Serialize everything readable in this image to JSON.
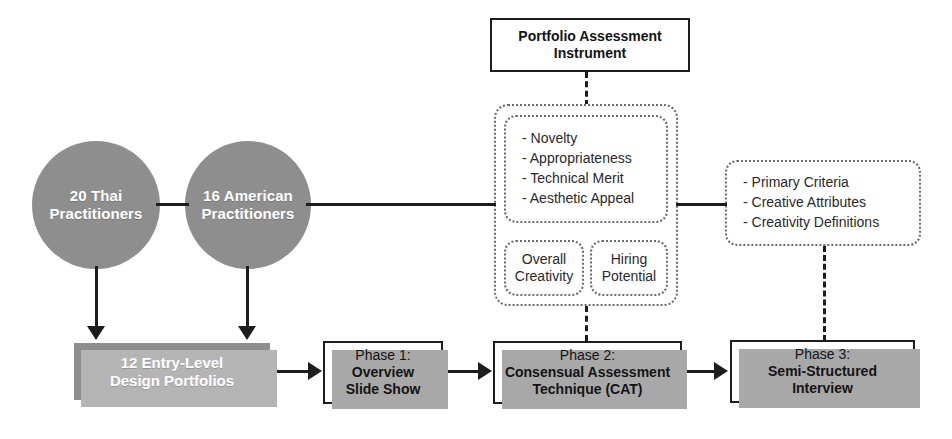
{
  "diagram": {
    "title": "Portfolio Assessment Instrument",
    "colors": {
      "fill_gray": "#8e8e8e",
      "shadow_gray": "#b4b4b4",
      "stroke_black": "#1d1d1d",
      "dashed_gray": "#6b6b6b",
      "text_white": "#ffffff",
      "text_dark": "#2a2a2a",
      "background": "#ffffff"
    },
    "participants": [
      {
        "id": "thai",
        "line1": "20 Thai",
        "line2": "Practitioners"
      },
      {
        "id": "american",
        "line1": "16 American",
        "line2": "Practitioners"
      }
    ],
    "portfolios": {
      "line1": "12 Entry-Level",
      "line2": "Design Portfolios"
    },
    "instrument": {
      "title_line1": "Portfolio Assessment",
      "title_line2": "Instrument",
      "criteria": [
        "- Novelty",
        "- Appropriateness",
        "- Technical Merit",
        "- Aesthetic Appeal"
      ],
      "ratings": [
        {
          "line1": "Overall",
          "line2": "Creativity"
        },
        {
          "line1": "Hiring",
          "line2": "Potential"
        }
      ]
    },
    "interview_topics": [
      "- Primary Criteria",
      "- Creative Attributes",
      "- Creativity Definitions"
    ],
    "phases": [
      {
        "id": "phase-1",
        "head": "Phase 1:",
        "body_line1": "Overview",
        "body_line2": "Slide Show"
      },
      {
        "id": "phase-2",
        "head": "Phase 2:",
        "body_line1": "Consensual Assessment",
        "body_line2": "Technique (CAT)"
      },
      {
        "id": "phase-3",
        "head": "Phase 3:",
        "body_line1": "Semi-Structured",
        "body_line2": "Interview"
      }
    ]
  }
}
